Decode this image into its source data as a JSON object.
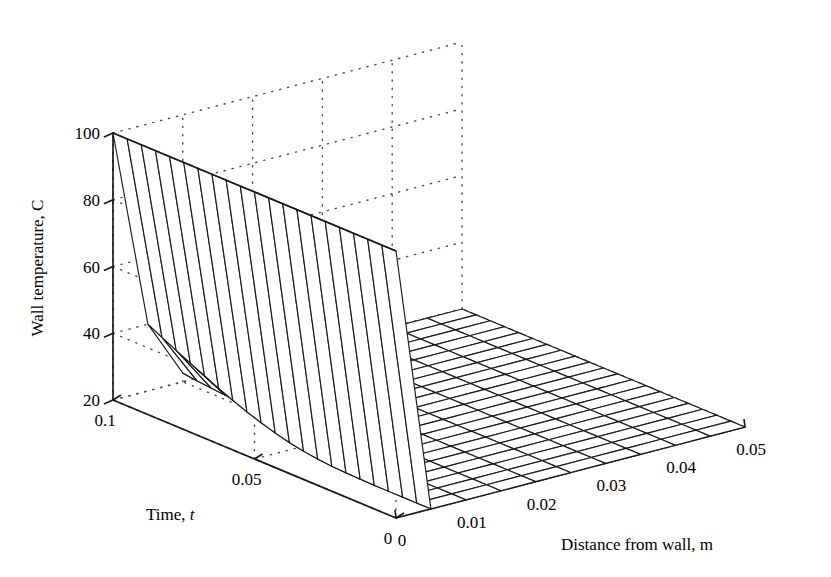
{
  "figure": {
    "background_color": "#ffffff",
    "line_color": "#1a1a1a",
    "grid_color": "#4d4d4d"
  },
  "axes": {
    "y": {
      "label": "Wall temperature, C",
      "ticks": [
        "20",
        "40",
        "60",
        "80",
        "100"
      ],
      "values": [
        20,
        40,
        60,
        80,
        100
      ],
      "range": [
        20,
        100
      ]
    },
    "time": {
      "label": "Time, ",
      "label_italic": "t",
      "ticks": [
        "0.1",
        "0.05",
        "0"
      ],
      "values": [
        0.1,
        0.05,
        0
      ],
      "range": [
        0,
        0.1
      ]
    },
    "distance": {
      "label": "Distance from wall, m",
      "ticks": [
        "0",
        "0.01",
        "0.02",
        "0.03",
        "0.04",
        "0.05"
      ],
      "values": [
        0,
        0.01,
        0.02,
        0.03,
        0.04,
        0.05
      ],
      "range": [
        0,
        0.05
      ]
    }
  },
  "chart_data": {
    "type": "surface",
    "title": "",
    "xlabel": "Distance from wall, m",
    "ylabel": "Time, t",
    "zlabel": "Wall temperature, C",
    "xlim": [
      0,
      0.05
    ],
    "ylim": [
      0,
      0.1
    ],
    "zlim": [
      20,
      100
    ],
    "grid": true,
    "legend": "none",
    "x": [
      0,
      0.005,
      0.01,
      0.015,
      0.02,
      0.025,
      0.03,
      0.035,
      0.04,
      0.045,
      0.05
    ],
    "y": [
      0,
      0.005,
      0.01,
      0.015,
      0.02,
      0.025,
      0.03,
      0.035,
      0.04,
      0.045,
      0.05,
      0.055,
      0.06,
      0.065,
      0.07,
      0.075,
      0.08,
      0.085,
      0.09,
      0.095,
      0.1
    ],
    "z_description": "Transient conduction: wall face held near 100 C at x=0, decaying to 20 C ambient within a thin boundary layer; plateau at 20 C for x >= 0.005",
    "z_wall_column_x0": [
      100,
      100,
      100,
      100,
      100,
      100,
      100,
      100,
      100,
      100,
      100,
      100,
      100,
      100,
      100,
      100,
      100,
      100,
      100,
      100,
      100
    ],
    "z_column_x1": [
      20.0,
      20.0,
      20.0,
      20.0,
      20.0,
      20.1,
      20.2,
      20.4,
      20.8,
      21.4,
      22.2,
      23.3,
      24.6,
      26.1,
      27.8,
      29.6,
      31.6,
      33.6,
      35.7,
      37.8,
      40.0
    ],
    "z_column_x2": [
      20.0,
      20.0,
      20.0,
      20.0,
      20.0,
      20.0,
      20.0,
      20.0,
      20.0,
      20.0,
      20.1,
      20.1,
      20.2,
      20.3,
      20.5,
      20.7,
      21.0,
      21.3,
      21.7,
      22.1,
      22.6
    ],
    "z_plateau_value": 20,
    "mesh_divisions_x": 10,
    "mesh_divisions_y": 20
  },
  "projection": {
    "origin_back_left": [
      113,
      400
    ],
    "front_bottom": [
      396,
      518
    ],
    "right_bottom": [
      745,
      427
    ],
    "top_left": [
      113,
      133
    ],
    "top_back": [
      470,
      40
    ],
    "z_pixel_height": 267
  }
}
